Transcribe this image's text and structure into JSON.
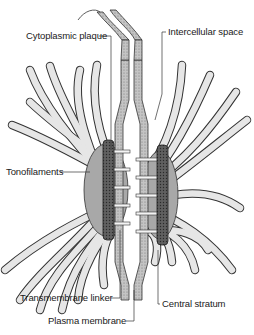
{
  "figure": {
    "labels": {
      "cytoplasmic_plaque": "Cytoplasmic plaque",
      "intercellular_space": "Intercellular space",
      "tonofilaments": "Tonofilaments",
      "transmembrane_linker": "Transmembrane linker",
      "central_stratum": "Central stratum",
      "plasma_membrane": "Plasma membrane"
    }
  },
  "colors": {
    "filament_fill": "#e4e4e4",
    "filament_stroke": "#333333",
    "plaque_dark": "#6a6a6a",
    "cytoplasm_gray": "#a8a8a8",
    "membrane_stipple": "#bdbdbd",
    "linker": "#f4f4f4"
  }
}
